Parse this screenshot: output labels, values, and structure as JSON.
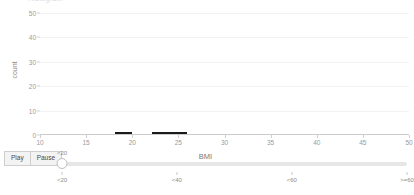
{
  "clipped_title": "Histogram",
  "chart_data": {
    "type": "bar",
    "title": "",
    "xlabel": "BMI",
    "ylabel": "count",
    "xlim": [
      10,
      50
    ],
    "ylim": [
      0,
      52
    ],
    "grid": true,
    "legend": "none",
    "bar_color": "#1a1a1a",
    "xticks": [
      10,
      15,
      20,
      25,
      30,
      35,
      40,
      45,
      50
    ],
    "yticks": [
      0,
      10,
      20,
      30,
      40,
      50
    ],
    "xtick_labels": [
      "10",
      "15",
      "20",
      "25",
      "30",
      "35",
      "40",
      "45",
      "50"
    ],
    "ytick_labels": [
      "0",
      "10",
      "20",
      "30",
      "40",
      "50"
    ],
    "bars": [
      {
        "x0": 18.1,
        "x1": 20.0,
        "value": 0.6
      },
      {
        "x0": 22.1,
        "x1": 25.9,
        "value": 0.6
      }
    ]
  },
  "controls": {
    "play_label": "Play",
    "pause_label": "Pause",
    "slider": {
      "value_label": "<20",
      "value_index": 0,
      "ticks": [
        "<20",
        "<40",
        "<60",
        ">=60"
      ],
      "tick_positions": [
        0,
        33.3,
        66.6,
        100
      ]
    }
  },
  "colors": {
    "bar": "#1a1a1a",
    "grid": "#f2f2f2",
    "axis": "#cccccc",
    "tick_text": "#9a9a9a",
    "label_text": "#777777",
    "control_bg": "#f3f3f3",
    "control_border": "#cfcfcf",
    "slider_track": "#e6e6e6"
  }
}
